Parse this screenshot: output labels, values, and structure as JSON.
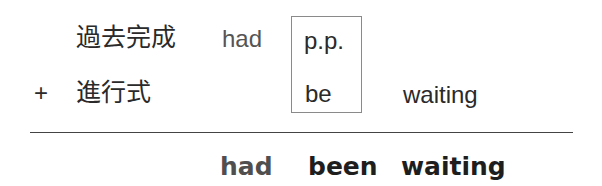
{
  "diagram": {
    "row1": {
      "label": "過去完成",
      "auxiliary": "had",
      "boxed": "p.p."
    },
    "row2": {
      "operator": "+",
      "label": "進行式",
      "boxed": "be",
      "verb": "waiting"
    },
    "result": {
      "auxiliary": "had",
      "participle": "been",
      "verb": "waiting"
    },
    "colors": {
      "text": "#222222",
      "auxiliary_gray": "#555555",
      "box_border": "#8a8a8a",
      "rule": "#444444",
      "background": "#ffffff"
    }
  }
}
